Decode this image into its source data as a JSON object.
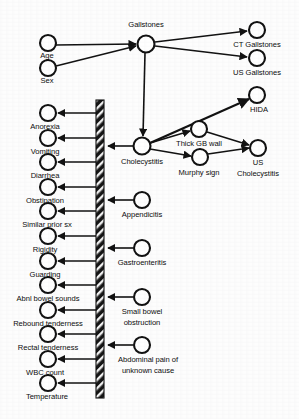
{
  "diagram": {
    "type": "directed-graph",
    "canvas": {
      "width": 299,
      "height": 419
    },
    "colors": {
      "background": "#fdfdfd",
      "node_fill": "#ffffff",
      "node_stroke": "#111111",
      "edge": "#111111",
      "barrier": "#1a1a1a",
      "text": "#0c0c0c"
    },
    "barrier": {
      "name": "hatched-separator-bar",
      "x": 96,
      "y": 100,
      "width": 8,
      "height": 298,
      "pattern": "diagonal-hatch"
    },
    "nodes": [
      {
        "id": "age",
        "label": "Age",
        "cx": 48,
        "cy": 43,
        "r": 8,
        "label_x": 48,
        "label_y": 57,
        "anchor": "middle"
      },
      {
        "id": "sex",
        "label": "Sex",
        "cx": 48,
        "cy": 68,
        "r": 8,
        "label_x": 48,
        "label_y": 82,
        "anchor": "middle"
      },
      {
        "id": "gallstones",
        "label": "Gallstones",
        "cx": 146,
        "cy": 44,
        "r": 8.5,
        "label_x": 146,
        "label_y": 27,
        "anchor": "middle"
      },
      {
        "id": "ct_gallstones",
        "label": "CT Gallstones",
        "cx": 257,
        "cy": 30,
        "r": 8,
        "label_x": 257,
        "label_y": 46,
        "anchor": "middle"
      },
      {
        "id": "us_gallstones",
        "label": "US Gallstones",
        "cx": 257,
        "cy": 58,
        "r": 8,
        "label_x": 257,
        "label_y": 74,
        "anchor": "middle"
      },
      {
        "id": "hida",
        "label": "HIDA",
        "cx": 257,
        "cy": 95,
        "r": 8,
        "label_x": 257,
        "label_y": 111,
        "anchor": "middle"
      },
      {
        "id": "cholecystitis",
        "label": "Cholecystitis",
        "cx": 142,
        "cy": 146,
        "r": 8.5,
        "label_x": 142,
        "label_y": 163,
        "anchor": "middle"
      },
      {
        "id": "thick_gb_wall",
        "label": "Thick GB wall",
        "cx": 199,
        "cy": 129,
        "r": 8,
        "label_x": 199,
        "label_y": 145,
        "anchor": "middle"
      },
      {
        "id": "murphy_sign",
        "label": "Murphy sign",
        "cx": 200,
        "cy": 157,
        "r": 8,
        "label_x": 200,
        "label_y": 173,
        "anchor": "middle"
      },
      {
        "id": "us_chole",
        "label": "US\nCholecystitis",
        "cx": 258,
        "cy": 148,
        "r": 8,
        "label_x": 258,
        "label_y": 164,
        "anchor": "middle"
      },
      {
        "id": "appendicitis",
        "label": "Appendicitis",
        "cx": 142,
        "cy": 200,
        "r": 8,
        "label_x": 142,
        "label_y": 216,
        "anchor": "middle"
      },
      {
        "id": "gastroenteritis",
        "label": "Gastroenteritis",
        "cx": 142,
        "cy": 248,
        "r": 8,
        "label_x": 142,
        "label_y": 264,
        "anchor": "middle"
      },
      {
        "id": "sbo",
        "label": "Small bowel\nobstruction",
        "cx": 142,
        "cy": 297,
        "r": 8,
        "label_x": 142,
        "label_y": 313,
        "anchor": "middle"
      },
      {
        "id": "abd_pain",
        "label": "Abdominal pain of\nunknown cause",
        "cx": 142,
        "cy": 345,
        "r": 8,
        "label_x": 142,
        "label_y": 361,
        "anchor": "middle"
      },
      {
        "id": "anorexia",
        "label": "Anorexia",
        "cx": 48,
        "cy": 113,
        "r": 8,
        "label_x": 48,
        "label_y": 128,
        "anchor": "middle"
      },
      {
        "id": "vomiting",
        "label": "Vomiting",
        "cx": 48,
        "cy": 138,
        "r": 8,
        "label_x": 48,
        "label_y": 153,
        "anchor": "middle"
      },
      {
        "id": "diarrhea",
        "label": "Diarrhea",
        "cx": 48,
        "cy": 162,
        "r": 8,
        "label_x": 48,
        "label_y": 177,
        "anchor": "middle"
      },
      {
        "id": "obstipation",
        "label": "Obstipation",
        "cx": 48,
        "cy": 187,
        "r": 8,
        "label_x": 48,
        "label_y": 202,
        "anchor": "middle"
      },
      {
        "id": "similar_prior",
        "label": "Similar prior sx",
        "cx": 48,
        "cy": 211,
        "r": 8,
        "label_x": 48,
        "label_y": 226,
        "anchor": "middle"
      },
      {
        "id": "rigidity",
        "label": "Rigidity",
        "cx": 48,
        "cy": 236,
        "r": 8,
        "label_x": 48,
        "label_y": 251,
        "anchor": "middle"
      },
      {
        "id": "guarding",
        "label": "Guarding",
        "cx": 48,
        "cy": 261,
        "r": 8,
        "label_x": 48,
        "label_y": 276,
        "anchor": "middle"
      },
      {
        "id": "abnl_bowel",
        "label": "Abnl bowel sounds",
        "cx": 48,
        "cy": 285,
        "r": 8,
        "label_x": 48,
        "label_y": 300,
        "anchor": "middle"
      },
      {
        "id": "rebound",
        "label": "Rebound tenderness",
        "cx": 48,
        "cy": 310,
        "r": 8,
        "label_x": 48,
        "label_y": 325,
        "anchor": "middle"
      },
      {
        "id": "rectal",
        "label": "Rectal tenderness",
        "cx": 48,
        "cy": 334,
        "r": 8,
        "label_x": 48,
        "label_y": 349,
        "anchor": "middle"
      },
      {
        "id": "wbc",
        "label": "WBC count",
        "cx": 48,
        "cy": 359,
        "r": 8,
        "label_x": 48,
        "label_y": 374,
        "anchor": "middle"
      },
      {
        "id": "temperature",
        "label": "Temperature",
        "cx": 48,
        "cy": 383,
        "r": 8,
        "label_x": 48,
        "label_y": 398,
        "anchor": "middle"
      }
    ],
    "node_labels": {
      "age": "Age",
      "sex": "Sex",
      "gallstones": "Gallstones",
      "ct_gallstones": "CT Gallstones",
      "us_gallstones": "US Gallstones",
      "hida": "HIDA",
      "cholecystitis": "Cholecystitis",
      "thick_gb_wall": "Thick GB wall",
      "murphy_sign": "Murphy sign",
      "us_chole_line1": "US",
      "us_chole_line2": "Cholecystitis",
      "appendicitis": "Appendicitis",
      "gastroenteritis": "Gastroenteritis",
      "sbo_line1": "Small bowel",
      "sbo_line2": "obstruction",
      "abd_pain_line1": "Abdominal pain of",
      "abd_pain_line2": "unknown cause",
      "anorexia": "Anorexia",
      "vomiting": "Vomiting",
      "diarrhea": "Diarrhea",
      "obstipation": "Obstipation",
      "similar_prior": "Similar prior sx",
      "rigidity": "Rigidity",
      "guarding": "Guarding",
      "abnl_bowel": "Abnl bowel sounds",
      "rebound": "Rebound tenderness",
      "rectal": "Rectal tenderness",
      "wbc": "WBC count",
      "temperature": "Temperature"
    },
    "edges": [
      {
        "from": "age",
        "to": "gallstones",
        "arrow": true
      },
      {
        "from": "sex",
        "to": "gallstones",
        "arrow": true
      },
      {
        "from": "gallstones",
        "to": "ct_gallstones",
        "arrow": true
      },
      {
        "from": "gallstones",
        "to": "us_gallstones",
        "arrow": true
      },
      {
        "from": "gallstones",
        "to": "cholecystitis",
        "arrow": true
      },
      {
        "from": "cholecystitis",
        "to": "hida",
        "arrow": true
      },
      {
        "from": "cholecystitis",
        "to": "thick_gb_wall",
        "arrow": true
      },
      {
        "from": "cholecystitis",
        "to": "murphy_sign",
        "arrow": true
      },
      {
        "from": "thick_gb_wall",
        "to": "us_chole",
        "arrow": true
      },
      {
        "from": "murphy_sign",
        "to": "us_chole",
        "arrow": true
      },
      {
        "from": "cholecystitis",
        "to": "barrier",
        "arrow": true
      },
      {
        "from": "appendicitis",
        "to": "barrier",
        "arrow": true
      },
      {
        "from": "gastroenteritis",
        "to": "barrier",
        "arrow": true
      },
      {
        "from": "sbo",
        "to": "barrier",
        "arrow": true
      },
      {
        "from": "abd_pain",
        "to": "barrier",
        "arrow": true
      },
      {
        "from": "barrier",
        "to": "anorexia",
        "arrow": true
      },
      {
        "from": "barrier",
        "to": "vomiting",
        "arrow": true
      },
      {
        "from": "barrier",
        "to": "diarrhea",
        "arrow": true
      },
      {
        "from": "barrier",
        "to": "obstipation",
        "arrow": true
      },
      {
        "from": "barrier",
        "to": "similar_prior",
        "arrow": true
      },
      {
        "from": "barrier",
        "to": "rigidity",
        "arrow": true
      },
      {
        "from": "barrier",
        "to": "guarding",
        "arrow": true
      },
      {
        "from": "barrier",
        "to": "abnl_bowel",
        "arrow": true
      },
      {
        "from": "barrier",
        "to": "rebound",
        "arrow": true
      },
      {
        "from": "barrier",
        "to": "rectal",
        "arrow": true
      },
      {
        "from": "barrier",
        "to": "wbc",
        "arrow": true
      },
      {
        "from": "barrier",
        "to": "temperature",
        "arrow": true
      }
    ]
  }
}
